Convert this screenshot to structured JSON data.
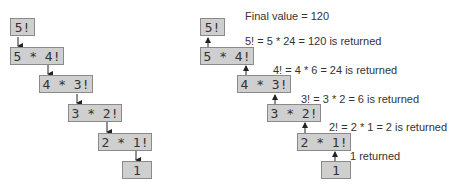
{
  "left_diagram": {
    "title": "Sequence of recursive calls",
    "boxes": [
      "5!",
      "5 * 4!",
      "4 * 3!",
      "3 * 2!",
      "2 * 1!",
      "1"
    ]
  },
  "right_diagram": {
    "title": "Values returned from each recursive call",
    "boxes": [
      "5!",
      "5 * 4!",
      "4 * 3!",
      "3 * 2!",
      "2 * 1!",
      "1"
    ],
    "labels": [
      "Final value = 120",
      "5! = 5 * 24 = 120 is returned",
      "4! = 4 * 6 = 24 is returned",
      "3! = 3 * 2 = 6 is returned",
      "2! = 2 * 1 = 2 is returned",
      "1 returned"
    ]
  },
  "colors": {
    "box_fill": "#cfcfcf",
    "box_border": "#8a8a8a",
    "arrow": "#222222"
  }
}
